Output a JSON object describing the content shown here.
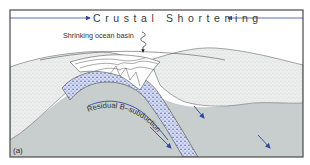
{
  "figure": {
    "title": "Crustal Shortening",
    "panel_label": "(a)",
    "labels": {
      "ocean_basin": "Shrinking ocean basin",
      "subduction": "Residual B–subduction"
    },
    "icons": {
      "left_arrow": "arrow-right-icon",
      "right_arrow": "arrow-left-icon",
      "squiggle": "wavy-down-arrow-icon",
      "motion_arrows": "arrow-down-right-icon"
    },
    "colors": {
      "frame": "#4a4a4a",
      "arrow_blue": "#2f4aa0",
      "mantle_gray": "#c7cccd",
      "crust_stipple": "#e9ebea",
      "slab_blue": "#9aa6d8",
      "sediment_white": "#ffffff"
    }
  }
}
